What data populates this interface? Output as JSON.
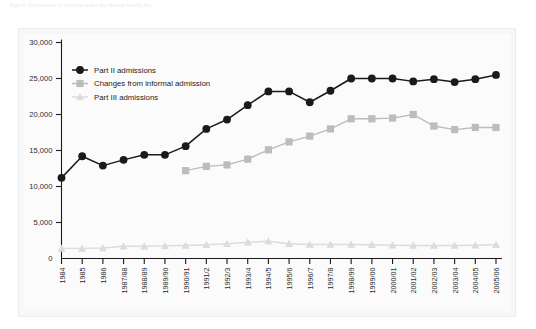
{
  "figure": {
    "caption_strip": "Figure: Admissions to hospital under the Mental Health Act"
  },
  "chart_data": {
    "type": "line",
    "title": "",
    "subtitle": "",
    "xlabel": "",
    "ylabel": "",
    "ylim": [
      0,
      30000
    ],
    "yticks": [
      0,
      5000,
      10000,
      15000,
      20000,
      25000,
      30000
    ],
    "ytick_labels": [
      "0",
      "5,000",
      "10,000",
      "15,000",
      "20,000",
      "25,000",
      "30,000"
    ],
    "grid": false,
    "legend_position": "top-left",
    "categories": [
      "1984",
      "1985",
      "1986",
      "1987/88",
      "1988/89",
      "1989/90",
      "1990/91",
      "1991/2",
      "1992/3",
      "1993/4",
      "1994/5",
      "1995/6",
      "1996/7",
      "1997/8",
      "1998/99",
      "1999/00",
      "2000/01",
      "2001/02",
      "2002/03",
      "2003/04",
      "2004/05",
      "2005/06"
    ],
    "series": [
      {
        "name": "Part II admissions",
        "color": "#1a1a1a",
        "marker": "circle",
        "values": [
          11200,
          14200,
          12900,
          13700,
          14400,
          14400,
          15600,
          18000,
          19300,
          21300,
          23200,
          23200,
          21700,
          23300,
          25000,
          25000,
          25000,
          24600,
          24900,
          24500,
          24900,
          25500
        ]
      },
      {
        "name": "Changes from informal admission",
        "color": "#bcbcbc",
        "marker": "square",
        "values": [
          null,
          null,
          null,
          null,
          null,
          null,
          12200,
          12800,
          13000,
          13800,
          15100,
          16200,
          17000,
          18000,
          19400,
          19400,
          19500,
          20000,
          18400,
          17900,
          18200,
          18200
        ]
      },
      {
        "name": "Part III admissions",
        "color": "#dcdcdc",
        "marker": "triangle",
        "values": [
          1400,
          1400,
          1450,
          1700,
          1700,
          1750,
          1800,
          1900,
          2050,
          2250,
          2400,
          2050,
          1950,
          1950,
          1950,
          1900,
          1850,
          1800,
          1800,
          1800,
          1850,
          1900
        ]
      }
    ]
  }
}
